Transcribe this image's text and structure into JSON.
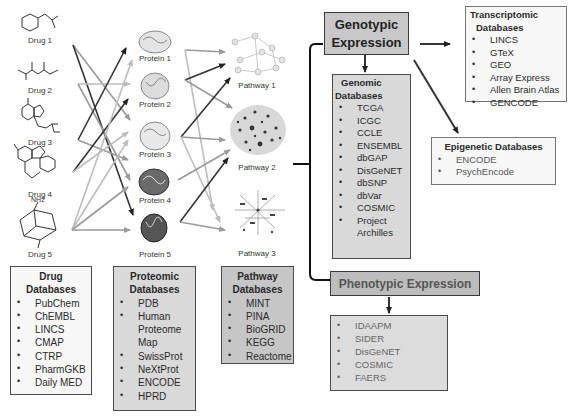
{
  "drugs": [
    {
      "label": "Drug 1"
    },
    {
      "label": "Drug 2"
    },
    {
      "label": "Drug 3"
    },
    {
      "label": "Drug 4"
    },
    {
      "label": "Drug 5",
      "top_group": "NH2"
    }
  ],
  "proteins": [
    {
      "label": "Protein 1"
    },
    {
      "label": "Protein 2"
    },
    {
      "label": "Protein 3"
    },
    {
      "label": "Protein 4"
    },
    {
      "label": "Protein 5"
    }
  ],
  "pathways": [
    {
      "label": "Pathway 1"
    },
    {
      "label": "Pathway 2"
    },
    {
      "label": "Pathway 3"
    }
  ],
  "drug_databases": {
    "title_line1": "Drug",
    "title_line2": "Databases",
    "items": [
      "PubChem",
      "ChEMBL",
      "LINCS",
      "CMAP",
      "CTRP",
      "PharmGKB",
      "Daily MED"
    ]
  },
  "proteomic_databases": {
    "title_line1": "Proteomic",
    "title_line2": "Databases",
    "items": [
      "PDB",
      "Human",
      "Proteome",
      "Map",
      "SwissProt",
      "NeXtProt",
      "ENCODE",
      "HPRD"
    ]
  },
  "pathway_databases": {
    "title_line1": "Pathway",
    "title_line2": "Databases",
    "items": [
      "MINT",
      "PINA",
      "BioGRID",
      "KEGG",
      "Reactome"
    ]
  },
  "genotypic_expression": {
    "line1": "Genotypic",
    "line2": "Expression"
  },
  "genomic_databases": {
    "title_line1": "Genomic",
    "title_line2": "Databases",
    "items": [
      "TCGA",
      "ICGC",
      "CCLE",
      "ENSEMBL",
      "dbGAP",
      "DisGeNET",
      "dbSNP",
      "dbVar",
      "COSMIC",
      "Project",
      "Archilles"
    ]
  },
  "transcriptomic_databases": {
    "title_line1": "Transcriptomic",
    "title_line2": "Databases",
    "items": [
      "LINCS",
      "GTeX",
      "GEO",
      "Array Express",
      "Allen Brain Atlas",
      "GENCODE"
    ]
  },
  "epigenetic_databases": {
    "title": "Epigenetic Databases",
    "items": [
      "ENCODE",
      "PsychEncode"
    ]
  },
  "phenotypic_expression": {
    "label": "Phenotypic Expression",
    "items": [
      "IDAAPM",
      "SIDER",
      "DisGeNET",
      "COSMIC",
      "FAERS"
    ]
  }
}
